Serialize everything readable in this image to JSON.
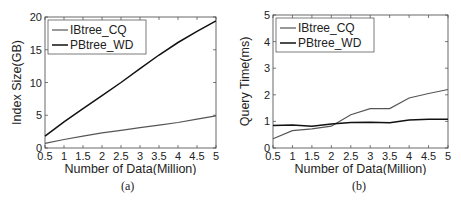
{
  "chart_data": [
    {
      "type": "line",
      "caption": "(a)",
      "title": "",
      "xlabel": "Number of Data(Million)",
      "ylabel": "Index Size(GB)",
      "x": [
        0.5,
        1,
        1.5,
        2,
        2.5,
        3,
        3.5,
        4,
        4.5,
        5
      ],
      "xticks": [
        "0.5",
        "1",
        "1.5",
        "2",
        "2.5",
        "3",
        "3.5",
        "4",
        "4.5",
        "5"
      ],
      "yticks": [
        "0",
        "5",
        "10",
        "15",
        "20"
      ],
      "xlim": [
        0.5,
        5
      ],
      "ylim": [
        0,
        20
      ],
      "legend_position": "upper left",
      "grid": false,
      "series": [
        {
          "name": "IBtree_CQ",
          "color": "#555555",
          "values": [
            0.7,
            1.3,
            1.8,
            2.3,
            2.7,
            3.1,
            3.5,
            3.9,
            4.4,
            4.9
          ]
        },
        {
          "name": "PBtree_WD",
          "color": "#111111",
          "values": [
            1.8,
            4.0,
            6.0,
            8.0,
            10.0,
            12.1,
            14.2,
            16.1,
            17.8,
            19.4
          ]
        }
      ]
    },
    {
      "type": "line",
      "caption": "(b)",
      "title": "",
      "xlabel": "Number of Data(Million)",
      "ylabel": "Query Time(ms)",
      "x": [
        0.5,
        1,
        1.5,
        2,
        2.5,
        3,
        3.5,
        4,
        4.5,
        5
      ],
      "xticks": [
        "0.5",
        "1",
        "1.5",
        "2",
        "2.5",
        "3",
        "3.5",
        "4",
        "4.5",
        "5"
      ],
      "yticks": [
        "0",
        "1",
        "2",
        "3",
        "4",
        "5"
      ],
      "xlim": [
        0.5,
        5
      ],
      "ylim": [
        0,
        5
      ],
      "legend_position": "upper left",
      "grid": false,
      "series": [
        {
          "name": "IBtree_CQ",
          "color": "#555555",
          "values": [
            0.35,
            0.65,
            0.72,
            0.82,
            1.25,
            1.48,
            1.48,
            1.88,
            2.05,
            2.2
          ]
        },
        {
          "name": "PBtree_WD",
          "color": "#111111",
          "values": [
            0.85,
            0.86,
            0.82,
            0.9,
            0.96,
            0.97,
            0.95,
            1.05,
            1.08,
            1.08
          ]
        }
      ]
    }
  ]
}
